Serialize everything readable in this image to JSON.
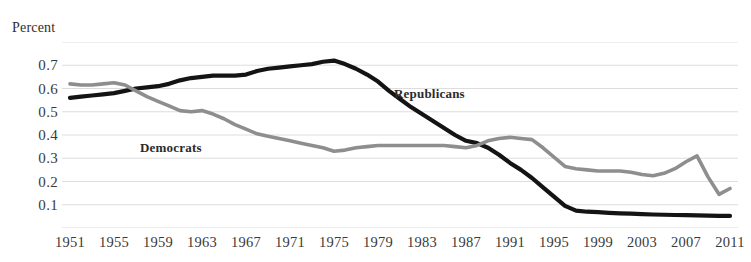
{
  "axis_caption": "Percent",
  "title_fragment": "",
  "colors": {
    "republicans": "#141414",
    "democrats": "#8e8e8e",
    "gridline": "#d9d9d9",
    "text": "#3a3a3a",
    "background": "#ffffff"
  },
  "series_labels": {
    "democrats": "Democrats",
    "republicans": "Republicans"
  },
  "chart_data": {
    "type": "line",
    "title": "",
    "subtitle": "",
    "xlabel": "",
    "ylabel": "Percent",
    "xlim": [
      1951,
      2011
    ],
    "ylim": [
      0.0,
      0.8
    ],
    "grid": true,
    "grid_axis": "y",
    "legend_position": "inline-annotation",
    "y_ticks": [
      0.1,
      0.2,
      0.3,
      0.4,
      0.5,
      0.6,
      0.7
    ],
    "y_tick_labels": [
      "0.1",
      "0.2",
      "0.3",
      "0.4",
      "0.5",
      "0.6",
      "0.7"
    ],
    "y_gridlines": [
      0.0,
      0.1,
      0.2,
      0.3,
      0.4,
      0.5,
      0.6,
      0.7,
      0.8
    ],
    "x_ticks": [
      1951,
      1955,
      1959,
      1963,
      1967,
      1971,
      1975,
      1979,
      1983,
      1987,
      1991,
      1995,
      1999,
      2003,
      2007,
      2011
    ],
    "x_tick_labels": [
      "1951",
      "1955",
      "1959",
      "1963",
      "1967",
      "1971",
      "1975",
      "1979",
      "1983",
      "1987",
      "1991",
      "1995",
      "1999",
      "2003",
      "2007",
      "2011"
    ],
    "x": [
      1951,
      1952,
      1953,
      1954,
      1955,
      1956,
      1957,
      1958,
      1959,
      1960,
      1961,
      1962,
      1963,
      1964,
      1965,
      1966,
      1967,
      1968,
      1969,
      1970,
      1971,
      1972,
      1973,
      1974,
      1975,
      1976,
      1977,
      1978,
      1979,
      1980,
      1981,
      1982,
      1983,
      1984,
      1985,
      1986,
      1987,
      1988,
      1989,
      1990,
      1991,
      1992,
      1993,
      1994,
      1995,
      1996,
      1997,
      1998,
      1999,
      2000,
      2001,
      2002,
      2003,
      2004,
      2005,
      2006,
      2007,
      2008,
      2009,
      2010,
      2011
    ],
    "series": [
      {
        "name": "Republicans",
        "color": "#141414",
        "values": [
          0.56,
          0.565,
          0.57,
          0.575,
          0.58,
          0.59,
          0.6,
          0.605,
          0.61,
          0.62,
          0.635,
          0.645,
          0.65,
          0.655,
          0.655,
          0.655,
          0.66,
          0.675,
          0.685,
          0.69,
          0.695,
          0.7,
          0.705,
          0.715,
          0.72,
          0.705,
          0.685,
          0.66,
          0.63,
          0.59,
          0.555,
          0.52,
          0.49,
          0.46,
          0.43,
          0.4,
          0.375,
          0.365,
          0.345,
          0.315,
          0.28,
          0.25,
          0.215,
          0.175,
          0.135,
          0.095,
          0.075,
          0.07,
          0.068,
          0.065,
          0.063,
          0.062,
          0.06,
          0.058,
          0.057,
          0.056,
          0.055,
          0.054,
          0.053,
          0.052,
          0.052
        ]
      },
      {
        "name": "Democrats",
        "color": "#8e8e8e",
        "values": [
          0.62,
          0.615,
          0.615,
          0.62,
          0.625,
          0.615,
          0.59,
          0.565,
          0.545,
          0.525,
          0.505,
          0.5,
          0.505,
          0.49,
          0.47,
          0.445,
          0.425,
          0.405,
          0.395,
          0.385,
          0.375,
          0.365,
          0.355,
          0.345,
          0.33,
          0.335,
          0.345,
          0.35,
          0.355,
          0.355,
          0.355,
          0.355,
          0.355,
          0.355,
          0.355,
          0.35,
          0.345,
          0.355,
          0.375,
          0.385,
          0.39,
          0.385,
          0.38,
          0.345,
          0.305,
          0.265,
          0.255,
          0.25,
          0.245,
          0.245,
          0.245,
          0.24,
          0.23,
          0.225,
          0.235,
          0.255,
          0.285,
          0.31,
          0.22,
          0.145,
          0.17
        ]
      }
    ]
  }
}
